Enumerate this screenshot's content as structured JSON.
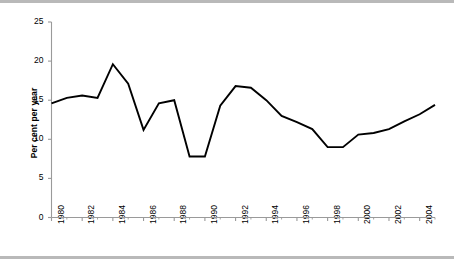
{
  "chart_data": {
    "type": "line",
    "title": "",
    "xlabel": "",
    "ylabel": "Per cent per year",
    "xlim": [
      1980,
      2005
    ],
    "ylim": [
      0,
      25
    ],
    "grid": false,
    "legend": null,
    "legend_position": "none",
    "yticks": [
      0,
      5,
      10,
      15,
      20,
      25
    ],
    "ytick_labels": [
      "0",
      "5",
      "10",
      "15",
      "20",
      "25"
    ],
    "xticks": [
      1980,
      1982,
      1984,
      1986,
      1988,
      1990,
      1992,
      1994,
      1996,
      1998,
      2000,
      2002,
      2004
    ],
    "xtick_labels": [
      "1980",
      "1982",
      "1984",
      "1986",
      "1988",
      "1990",
      "1992",
      "1994",
      "1996",
      "1998",
      "2000",
      "2002",
      "2004"
    ],
    "minor_xticks": [
      1981,
      1983,
      1985,
      1987,
      1989,
      1991,
      1993,
      1995,
      1997,
      1999,
      2001,
      2003,
      2005
    ],
    "x": [
      1980,
      1981,
      1982,
      1983,
      1984,
      1985,
      1986,
      1987,
      1988,
      1989,
      1990,
      1991,
      1992,
      1993,
      1994,
      1995,
      1996,
      1997,
      1998,
      1999,
      2000,
      2001,
      2002,
      2003,
      2004,
      2005
    ],
    "values": [
      14.6,
      15.3,
      15.6,
      15.3,
      19.6,
      17.1,
      11.2,
      14.6,
      15.0,
      7.8,
      7.8,
      14.3,
      16.8,
      16.6,
      15.0,
      13.0,
      12.2,
      11.3,
      9.0,
      9.0,
      10.6,
      10.8,
      11.3,
      12.3,
      13.2,
      14.4
    ],
    "series": [
      {
        "name": "Per cent per year",
        "color": "#000000",
        "values": [
          14.6,
          15.3,
          15.6,
          15.3,
          19.6,
          17.1,
          11.2,
          14.6,
          15.0,
          7.8,
          7.8,
          14.3,
          16.8,
          16.6,
          15.0,
          13.0,
          12.2,
          11.3,
          9.0,
          9.0,
          10.6,
          10.8,
          11.3,
          12.3,
          13.2,
          14.4
        ]
      }
    ],
    "line_color": "#000000",
    "axis_color": "#9a9a9a",
    "background_color": "#ffffff"
  }
}
